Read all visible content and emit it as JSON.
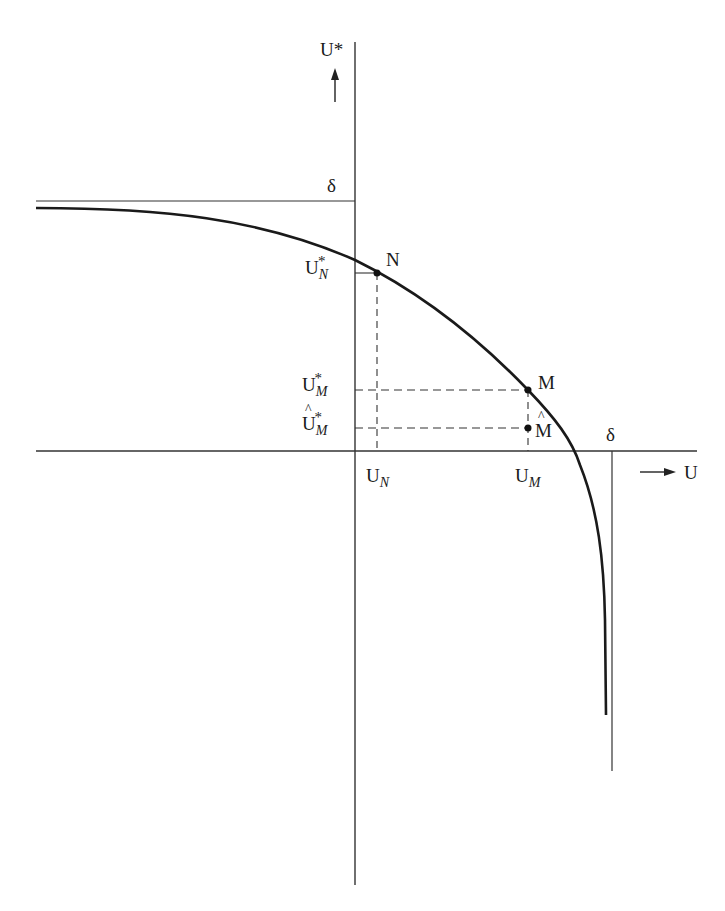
{
  "diagram": {
    "axes": {
      "y_axis_label": "U*",
      "x_axis_label": "U",
      "y_arrow": "up-arrow",
      "x_arrow": "right-arrow"
    },
    "asymptotes": {
      "horizontal_label": "δ",
      "vertical_label": "δ"
    },
    "points": [
      {
        "name": "N",
        "label": "N",
        "x_label": "U",
        "x_sub": "N",
        "y_label": "U",
        "y_sub": "N",
        "y_sup": "*"
      },
      {
        "name": "M",
        "label": "M",
        "x_label": "U",
        "x_sub": "M",
        "y_label": "U",
        "y_sub": "M",
        "y_sup": "*"
      },
      {
        "name": "M-hat",
        "label": "M",
        "y_label": "U",
        "y_sub": "M",
        "y_sup": "*"
      }
    ],
    "colors": {
      "curve": "#1a1a1a",
      "axes": "#333333",
      "dashed": "#333333"
    }
  }
}
